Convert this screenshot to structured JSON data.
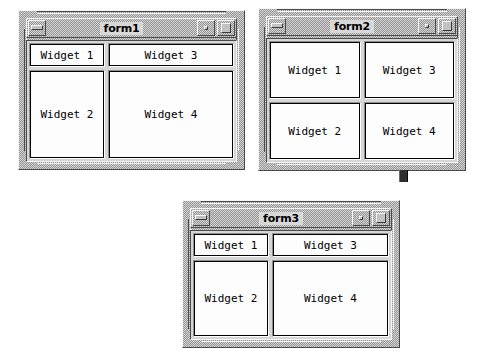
{
  "canvas": {
    "width": 481,
    "height": 364,
    "background_color": "#ffffff",
    "frame_color": "#cfcfcf",
    "frame_shadow_dark": "#4a4a4a",
    "frame_shadow_light": "#f4f4f4",
    "widget_fill_color": "#fdfdfd",
    "widget_border_color": "#000000",
    "text_color": "#000000"
  },
  "windows": [
    {
      "id": "form1",
      "title": "form1",
      "layout": "two-column-uneven",
      "position": {
        "x": 18,
        "y": 10,
        "width": 227,
        "height": 160
      },
      "titlebar": {
        "menu_button_label": "",
        "minimize_button_label": "",
        "maximize_button_label": ""
      },
      "widgets": [
        {
          "label": "Widget 1",
          "cell": "top-left"
        },
        {
          "label": "Widget 3",
          "cell": "top-right"
        },
        {
          "label": "Widget 2",
          "cell": "bottom-left"
        },
        {
          "label": "Widget 4",
          "cell": "bottom-right"
        }
      ]
    },
    {
      "id": "form2",
      "title": "form2",
      "layout": "two-by-two-equal",
      "position": {
        "x": 258,
        "y": 8,
        "width": 208,
        "height": 163
      },
      "titlebar": {
        "menu_button_label": "",
        "minimize_button_label": "",
        "maximize_button_label": ""
      },
      "widgets": [
        {
          "label": "Widget 1",
          "cell": "top-left"
        },
        {
          "label": "Widget 3",
          "cell": "top-right"
        },
        {
          "label": "Widget 2",
          "cell": "bottom-left"
        },
        {
          "label": "Widget 4",
          "cell": "bottom-right"
        }
      ]
    },
    {
      "id": "form3",
      "title": "form3",
      "layout": "two-column-uneven",
      "position": {
        "x": 182,
        "y": 200,
        "width": 218,
        "height": 148
      },
      "titlebar": {
        "menu_button_label": "",
        "minimize_button_label": "",
        "maximize_button_label": ""
      },
      "widgets": [
        {
          "label": "Widget 1",
          "cell": "top-left"
        },
        {
          "label": "Widget 3",
          "cell": "top-right"
        },
        {
          "label": "Widget 2",
          "cell": "bottom-left"
        },
        {
          "label": "Widget 4",
          "cell": "bottom-right"
        }
      ]
    }
  ],
  "decorations": {
    "form2_bottom_tab": {
      "x": 399,
      "y": 170,
      "width": 7,
      "height": 12,
      "color": "#2e2e2e"
    }
  }
}
